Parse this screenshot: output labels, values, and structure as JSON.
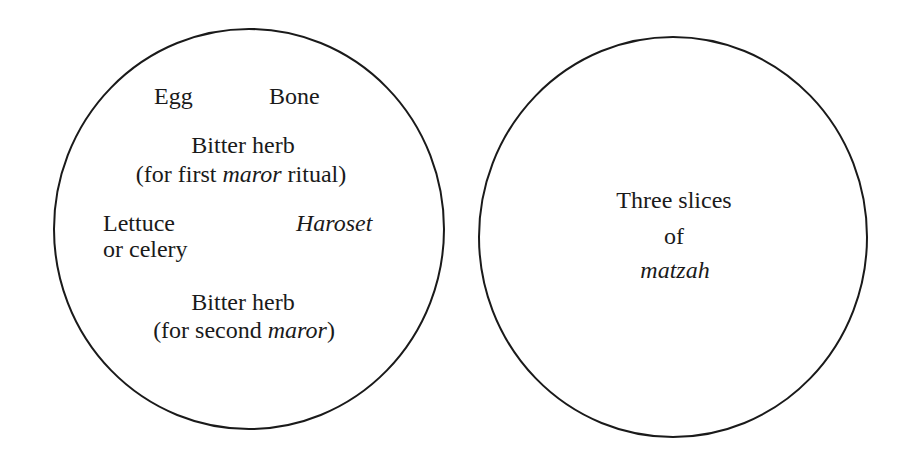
{
  "diagram": {
    "title": "",
    "stroke_color": "#1a1a1a",
    "background_color": "#ffffff",
    "plates": [
      {
        "id": "seder-plate",
        "items": {
          "egg": "Egg",
          "bone": "Bone",
          "bitter_herb_first": {
            "line1": "Bitter herb",
            "line2_pre": "(for first ",
            "line2_italic": "maror",
            "line2_post": " ritual)"
          },
          "lettuce": {
            "line1": "Lettuce",
            "line2": "or celery"
          },
          "haroset": "Haroset",
          "bitter_herb_second": {
            "line1": "Bitter herb",
            "line2_pre": "(for second ",
            "line2_italic": "maror",
            "line2_post": ")"
          }
        }
      },
      {
        "id": "matzah-plate",
        "items": {
          "line1": "Three slices",
          "line2": "of",
          "line3_italic": "matzah"
        }
      }
    ]
  }
}
